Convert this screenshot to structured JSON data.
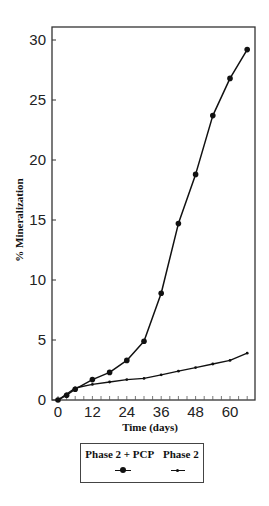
{
  "chart_data": {
    "type": "line",
    "title": "",
    "xlabel": "Time (days)",
    "ylabel": "% Mineralization",
    "xlim": [
      -3,
      69
    ],
    "ylim": [
      0,
      31
    ],
    "x_ticks": [
      0,
      12,
      24,
      36,
      48,
      60
    ],
    "x_tick_labels": [
      "0",
      "12",
      "24",
      "36",
      "48",
      "60"
    ],
    "x_minor_tick_step": 3,
    "y_ticks": [
      0,
      5,
      10,
      15,
      20,
      25,
      30
    ],
    "y_tick_labels": [
      "0",
      "5",
      "10",
      "15",
      "20",
      "25",
      "30"
    ],
    "grid": false,
    "legend_position": "below plot, boxed",
    "series": [
      {
        "name": "Phase 2 + PCP",
        "marker": "large-dot",
        "x": [
          0,
          3,
          6,
          12,
          18,
          24,
          30,
          36,
          42,
          48,
          54,
          60,
          66
        ],
        "values": [
          0,
          0.4,
          0.9,
          1.7,
          2.3,
          3.3,
          4.9,
          8.9,
          14.7,
          18.8,
          23.7,
          26.8,
          29.2
        ]
      },
      {
        "name": "Phase 2",
        "marker": "small-dot",
        "x": [
          0,
          3,
          6,
          12,
          18,
          24,
          30,
          36,
          42,
          48,
          54,
          60,
          66
        ],
        "values": [
          0,
          0.5,
          1.0,
          1.3,
          1.5,
          1.7,
          1.8,
          2.1,
          2.4,
          2.7,
          3.0,
          3.3,
          3.9
        ]
      }
    ]
  },
  "legend": {
    "items": [
      {
        "label": "Phase 2 + PCP"
      },
      {
        "label": "Phase 2"
      }
    ]
  },
  "axes": {
    "xlabel": "Time (days)",
    "ylabel": "% Mineralization"
  }
}
